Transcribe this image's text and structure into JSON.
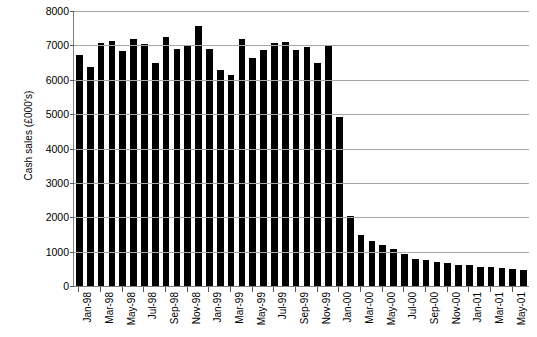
{
  "chart_data": {
    "type": "bar",
    "title": "",
    "subtitle": "",
    "xlabel": "",
    "ylabel": "Cash sales (£000's)",
    "ylim": [
      0,
      8000
    ],
    "ytick_step": 1000,
    "ytick_labels": [
      "0",
      "1000",
      "2000",
      "3000",
      "4000",
      "5000",
      "6000",
      "7000",
      "8000"
    ],
    "grid": true,
    "legend": null,
    "bar_color": "#000000",
    "categories": [
      "Jan-98",
      "Feb-98",
      "Mar-98",
      "Apr-98",
      "May-98",
      "Jun-98",
      "Jul-98",
      "Aug-98",
      "Sep-98",
      "Oct-98",
      "Nov-98",
      "Dec-98",
      "Jan-99",
      "Feb-99",
      "Mar-99",
      "Apr-99",
      "May-99",
      "Jun-99",
      "Jul-99",
      "Aug-99",
      "Sep-99",
      "Oct-99",
      "Nov-99",
      "Dec-99",
      "Jan-00",
      "Feb-00",
      "Mar-00",
      "Apr-00",
      "May-00",
      "Jun-00",
      "Jul-00",
      "Aug-00",
      "Sep-00",
      "Oct-00",
      "Nov-00",
      "Dec-00",
      "Jan-01",
      "Feb-01",
      "Mar-01",
      "Apr-01",
      "May-01",
      "Jun-01"
    ],
    "values": [
      6720,
      6370,
      7080,
      7120,
      6830,
      7200,
      7050,
      6480,
      7230,
      6900,
      6980,
      7560,
      6900,
      6280,
      6130,
      7200,
      6620,
      6880,
      7060,
      7100,
      6880,
      6950,
      6500,
      7010,
      4910,
      2030,
      1480,
      1320,
      1180,
      1080,
      940,
      800,
      760,
      700,
      670,
      620,
      600,
      560,
      540,
      520,
      500,
      480
    ],
    "xtick_labels_shown": [
      "Jan-98",
      "Mar-98",
      "May-98",
      "Jul-98",
      "Sep-98",
      "Nov-98",
      "Jan-99",
      "Mar-99",
      "May-99",
      "Jul-99",
      "Sep-99",
      "Nov-99",
      "Jan-00",
      "Mar-00",
      "May-00",
      "Jul-00",
      "Sep-00",
      "Nov-00",
      "Jan-01",
      "Mar-01",
      "May-01"
    ],
    "xtick_label_indices": [
      0,
      2,
      4,
      6,
      8,
      10,
      12,
      14,
      16,
      18,
      20,
      22,
      24,
      26,
      28,
      30,
      32,
      34,
      36,
      38,
      40
    ]
  }
}
